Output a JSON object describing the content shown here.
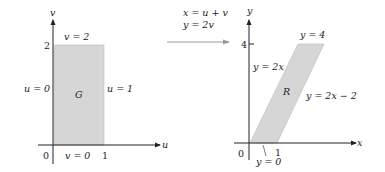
{
  "left_panel": {
    "axis_u_label": "u",
    "axis_v_label": "v",
    "origin_label": "0",
    "tick_u": "1",
    "tick_v": "2",
    "region_label": "G",
    "edge_top": "v = 2",
    "edge_bottom": "v = 0",
    "edge_left": "u = 0",
    "edge_right": "u = 1"
  },
  "transform": {
    "line1": "x = u + v",
    "line2": "y = 2v"
  },
  "right_panel": {
    "axis_x_label": "x",
    "axis_y_label": "y",
    "origin_label": "0",
    "tick_x": "1",
    "tick_y": "4",
    "region_label": "R",
    "edge_top": "y = 4",
    "edge_bottom": "y = 0",
    "edge_left": "y = 2x",
    "edge_right": "y = 2x − 2"
  },
  "colors": {
    "region_fill": "#d6d6d6",
    "axis": "#222222",
    "arrow": "#9a9a9a"
  }
}
